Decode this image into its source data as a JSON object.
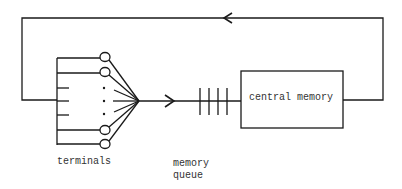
{
  "diagram": {
    "title": "",
    "nodes": {
      "terminals": {
        "label": "terminals"
      },
      "memory_queue": {
        "label_line1": "memory",
        "label_line2": "queue"
      },
      "central_memory": {
        "label": "central memory"
      }
    },
    "edges": [
      {
        "from": "terminals",
        "to": "memory_queue",
        "direction": "right"
      },
      {
        "from": "memory_queue",
        "to": "central_memory"
      },
      {
        "from": "central_memory",
        "to": "terminals",
        "direction": "left",
        "route": "top-loop"
      }
    ],
    "colors": {
      "line": "#1a1a1a",
      "text": "#333333",
      "background": "#ffffff"
    }
  }
}
